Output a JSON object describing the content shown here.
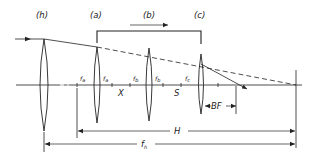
{
  "diagram": {
    "type": "optical-system",
    "lens_labels": {
      "h": "(h)",
      "a": "(a)",
      "b": "(b)",
      "c": "(c)"
    },
    "focal_points": {
      "fa_left": {
        "main": "f",
        "sub": "a"
      },
      "fa_right": {
        "main": "f",
        "sub": "a"
      },
      "fb_left": {
        "main": "f",
        "sub": "b"
      },
      "fb_right": {
        "main": "f",
        "sub": "b"
      },
      "fc": {
        "main": "f",
        "sub": "c"
      }
    },
    "spacing_labels": {
      "x": "X",
      "s": "S",
      "bf": "BF"
    },
    "dimension_labels": {
      "h_dim": "H",
      "fh": {
        "main": "f",
        "sub": "h"
      }
    },
    "colors": {
      "line": "#222222",
      "background": "#ffffff"
    }
  }
}
